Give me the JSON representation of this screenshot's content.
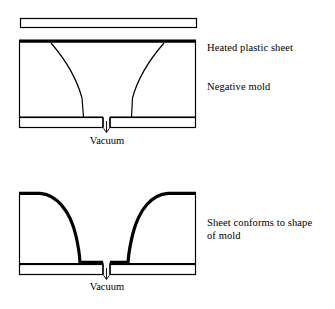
{
  "figure": {
    "background_color": "#ffffff",
    "line_color": "#000000"
  },
  "stage_one": {
    "name": "heating-stage",
    "labels": {
      "heated_sheet": "Heated plastic sheet",
      "negative_mold": "Negative mold",
      "vacuum": "Vacuum"
    },
    "geometry": {
      "sheet_bar": {
        "x": 20,
        "y": 18,
        "width": 177,
        "height": 9
      },
      "mold_box": {
        "x": 19,
        "y": 40,
        "width": 177,
        "height": 75
      },
      "mold_top_thickness": 3,
      "base_plate": {
        "y": 117,
        "height": 10,
        "left_x": 19,
        "left_width": 84,
        "right_x": 110,
        "right_width": 86
      },
      "cavity_left_curve_bottom_x": 84,
      "cavity_right_curve_bottom_x": 131,
      "vacuum_port": {
        "x": 103,
        "width": 7
      },
      "vacuum_arrow": {
        "x": 106,
        "y_top": 121,
        "y_bottom": 132
      }
    }
  },
  "stage_two": {
    "name": "forming-stage",
    "labels": {
      "conforms": "Sheet conforms to shape\nof mold",
      "vacuum": "Vacuum"
    },
    "geometry": {
      "mold_box": {
        "x": 19,
        "y": 192,
        "width": 177,
        "height": 71
      },
      "sheet_thickness": 3,
      "base_plate": {
        "y": 264,
        "height": 10,
        "left_x": 19,
        "left_width": 84,
        "right_x": 110,
        "right_width": 86
      },
      "cavity_left_wall_x": 80,
      "cavity_right_wall_x": 128,
      "cavity_floor_y": 262,
      "vacuum_port": {
        "x": 103,
        "width": 7
      },
      "vacuum_arrow": {
        "x": 106,
        "y_top": 268,
        "y_bottom": 279
      }
    }
  },
  "icons": {
    "vacuum_arrow": "arrow-down-icon"
  }
}
